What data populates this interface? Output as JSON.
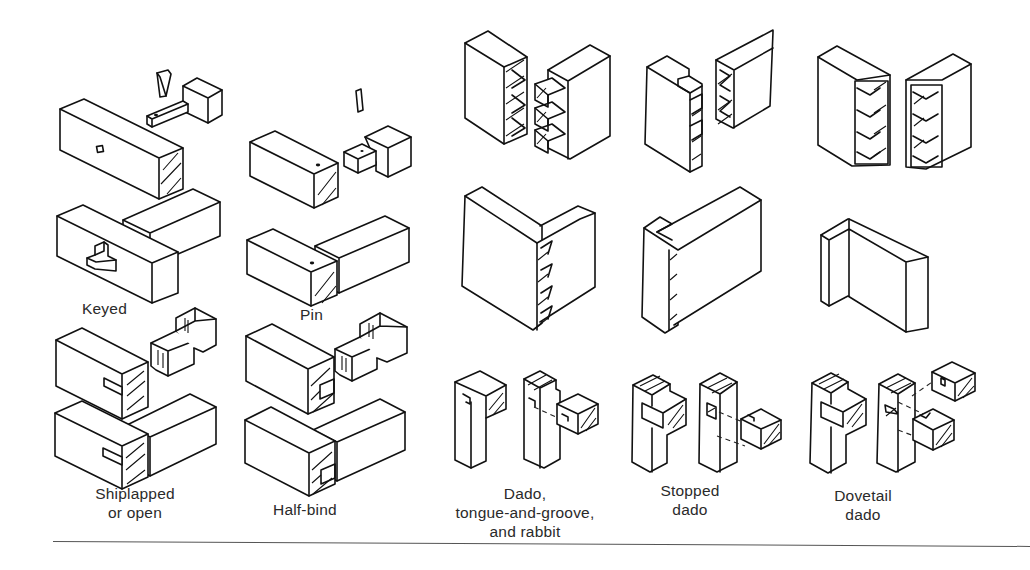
{
  "figure": {
    "background_color": "#ffffff",
    "line_color": "#111111"
  },
  "left_group": {
    "joints": [
      {
        "id": "keyed",
        "label": "Keyed"
      },
      {
        "id": "pin",
        "label": "Pin"
      },
      {
        "id": "shiplapped",
        "label_line1": "Shiplapped",
        "label_line2": "or open"
      },
      {
        "id": "half-bind",
        "label": "Half-bind"
      }
    ]
  },
  "right_group": {
    "dovetail_rows": [
      {
        "row": "exploded",
        "items": [
          "through-dovetail",
          "half-blind-dovetail",
          "blind-mitered-dovetail"
        ]
      },
      {
        "row": "assembled",
        "items": [
          "through-dovetail",
          "half-blind-dovetail",
          "blind-mitered-dovetail"
        ]
      }
    ],
    "dado_joints": [
      {
        "id": "dado-tongue-groove-rabbit",
        "label_line1": "Dado,",
        "label_line2": "tongue-and-groove,",
        "label_line3": "and rabbit"
      },
      {
        "id": "stopped-dado",
        "label_line1": "Stopped",
        "label_line2": "dado"
      },
      {
        "id": "dovetail-dado",
        "label_line1": "Dovetail",
        "label_line2": "dado"
      }
    ]
  }
}
